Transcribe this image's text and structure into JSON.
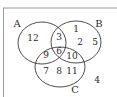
{
  "diagram": {
    "type": "venn",
    "sets": [
      {
        "label": "A",
        "cx": 42,
        "cy": 43,
        "rx": 24,
        "ry": 21,
        "label_x": 17,
        "label_y": 27
      },
      {
        "label": "B",
        "cx": 76,
        "cy": 42,
        "rx": 25,
        "ry": 21,
        "label_x": 99,
        "label_y": 27
      },
      {
        "label": "C",
        "cx": 60,
        "cy": 67,
        "rx": 25,
        "ry": 20,
        "label_x": 75,
        "label_y": 93
      }
    ],
    "regions": [
      {
        "name": "A-only",
        "value": "12",
        "x": 33,
        "y": 41
      },
      {
        "name": "A-and-B-only",
        "value": "3",
        "x": 59,
        "y": 40
      },
      {
        "name": "B-only-1",
        "value": "1",
        "x": 76,
        "y": 32
      },
      {
        "name": "B-only-2",
        "value": "2",
        "x": 80,
        "y": 45
      },
      {
        "name": "B-only-5",
        "value": "5",
        "x": 95,
        "y": 45
      },
      {
        "name": "A-and-C-only",
        "value": "9",
        "x": 46,
        "y": 58
      },
      {
        "name": "A-B-C",
        "value": "6",
        "x": 59,
        "y": 54
      },
      {
        "name": "B-and-C-only",
        "value": "10",
        "x": 72,
        "y": 59
      },
      {
        "name": "C-only-7",
        "value": "7",
        "x": 46,
        "y": 74
      },
      {
        "name": "C-only-8",
        "value": "8",
        "x": 59,
        "y": 74
      },
      {
        "name": "C-only-11",
        "value": "11",
        "x": 72,
        "y": 74
      },
      {
        "name": "outside",
        "value": "4",
        "x": 97,
        "y": 83
      }
    ],
    "colors": {
      "stroke": "#3a3a3a",
      "frame": "#9a9a9a",
      "text": "#2a2a2a"
    }
  }
}
